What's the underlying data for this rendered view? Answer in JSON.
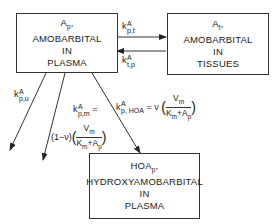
{
  "diagram": {
    "type": "pharmacokinetic-compartment-model",
    "boxes": {
      "plasma": {
        "line1": "A",
        "line1_sub": "p",
        "line1_suffix": ",",
        "line2": "AMOBARBITAL",
        "line3": "IN",
        "line4": "PLASMA"
      },
      "tissues": {
        "line1": "A",
        "line1_sub": "t",
        "line1_suffix": ",",
        "line2": "AMOBARBITAL",
        "line3": "IN",
        "line4": "TISSUES"
      },
      "metabolite": {
        "line1": "HOA",
        "line1_sub": "p",
        "line1_suffix": ",",
        "line2": "HYDROXYAMOBARBITAL",
        "line3": "IN",
        "line4": "PLASMA"
      }
    },
    "rates": {
      "k_pt": {
        "k": "k",
        "sup": "A",
        "sub": "p,t"
      },
      "k_tp": {
        "k": "k",
        "sup": "A",
        "sub": "t,p"
      },
      "k_pu": {
        "k": "k",
        "sup": "A",
        "sub": "p,u"
      },
      "k_pm": {
        "k": "k",
        "sup": "A",
        "sub": "p,m",
        "eq": "=",
        "prefix": "(1−ν)",
        "num": "V",
        "num_sub": "m",
        "den_a": "K",
        "den_a_sub": "m",
        "den_plus": "+",
        "den_b": "A",
        "den_b_sub": "p"
      },
      "k_pHOA": {
        "k": "k",
        "sup": "A",
        "sub": "p, HOA",
        "eq": "=",
        "prefix": "ν",
        "num": "V",
        "num_sub": "m",
        "den_a": "K",
        "den_a_sub": "m",
        "den_plus": "+",
        "den_b": "A",
        "den_b_sub": "p"
      }
    },
    "colors": {
      "line": "#333333",
      "background": "#ffffff"
    }
  }
}
